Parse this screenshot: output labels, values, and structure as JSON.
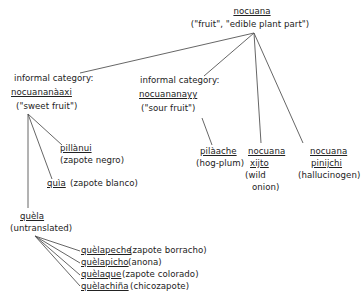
{
  "root": {
    "term": "nocuana",
    "gloss": "(\"fruit\", \"edible plant part\")"
  },
  "categories": [
    {
      "label": "informal category:",
      "term": "nocuananàaxi",
      "gloss": "(\"sweet fruit\")",
      "children": [
        {
          "term": "pillànui",
          "gloss": "(zapote negro)"
        },
        {
          "term": "quìa",
          "gloss": "(zapote blanco)"
        },
        {
          "term": "quèla",
          "gloss": "(untranslated)",
          "children": [
            {
              "term": "quèlapeche",
              "gloss": "(zapote borracho)"
            },
            {
              "term": "quèlapicho",
              "gloss": "(anona)"
            },
            {
              "term": "quèlaque",
              "gloss": "(zapote colorado)"
            },
            {
              "term": "quèlachiña",
              "gloss": "(chicozapote)"
            }
          ]
        }
      ]
    },
    {
      "label": "informal category:",
      "term": "nocuananayy",
      "gloss": "(\"sour fruit\")",
      "children": [
        {
          "term": "pilàache",
          "gloss": "(hog-plum)"
        }
      ]
    }
  ],
  "direct_children": [
    {
      "term_line1": "nocuana",
      "term_line2": "xijto",
      "gloss_line1": "(wild",
      "gloss_line2": "onion)"
    },
    {
      "term_line1": "nocuana",
      "term_line2": "pinijchi",
      "gloss": "(hallucinogen)"
    }
  ],
  "colors": {
    "ink": "#222222",
    "line": "#555555",
    "background": "#ffffff"
  }
}
